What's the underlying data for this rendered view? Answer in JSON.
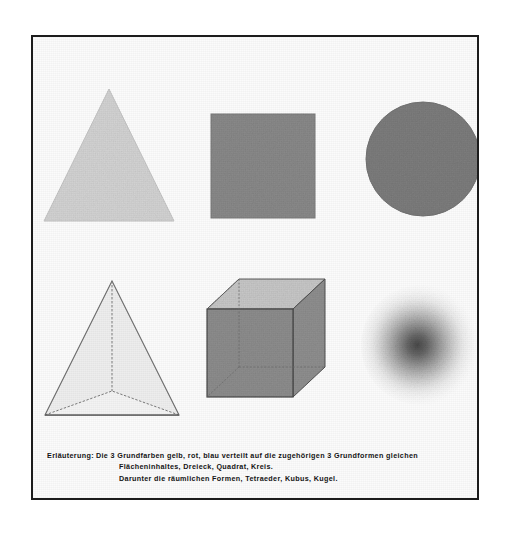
{
  "plate": {
    "title": "Grundfarben und Grundformen",
    "border_color": "#1c1c1c",
    "background_color": "#fbfbfb"
  },
  "figures": {
    "plane_row": [
      {
        "name": "triangle",
        "german_name": "Dreieck",
        "assigned_color": "gelb",
        "fill_hex": "#d4d4d4",
        "edge_hex": "#c2c2c2"
      },
      {
        "name": "square",
        "german_name": "Quadrat",
        "assigned_color": "rot",
        "fill_hex": "#8b8b8b",
        "edge_hex": "#7c7c7c"
      },
      {
        "name": "circle",
        "german_name": "Kreis",
        "assigned_color": "blau",
        "fill_hex": "#7e7e7e",
        "edge_hex": "#737373"
      }
    ],
    "solid_row": [
      {
        "name": "tetrahedron",
        "german_name": "Tetraeder",
        "fill_hex": "#ededed",
        "edge_hex": "#6f6f6f"
      },
      {
        "name": "cube",
        "german_name": "Kubus",
        "front_face_hex": "#8e8e8e",
        "top_face_hex": "#c9c9c9",
        "side_face_hex": "#909090",
        "edge_hex": "#4a4a4a"
      },
      {
        "name": "sphere",
        "german_name": "Kugel",
        "center_hex": "#4f4f4f",
        "edge_hex": "#f4f4f4"
      }
    ]
  },
  "caption": {
    "lead": "Erläuterung:",
    "line1_rest": "Die 3 Grundfarben gelb, rot, blau verteilt  auf  die  zugehörigen  3  Grundformen  gleichen",
    "line2": "Flächeninhaltes, Dreieck, Quadrat, Kreis.",
    "line3": "Darunter die räumlichen Formen, Tetraeder, Kubus, Kugel."
  }
}
